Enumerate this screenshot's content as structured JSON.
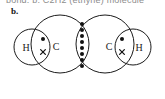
{
  "page": {
    "top_clipped_text": "bond. b. C2H2 (ethyne) molecule",
    "part_label": "b."
  },
  "diagram": {
    "name": "dot-and-cross-diagram",
    "molecule": "C2H2",
    "stroke_color": "#1b1b1b",
    "electron_color": "#111111",
    "background_color": "#ffffff",
    "atoms": [
      {
        "id": "h-left",
        "symbol": "H",
        "cx": 32,
        "cy": 47,
        "r": 18,
        "label_x": 26,
        "label_y": 47
      },
      {
        "id": "c-left",
        "symbol": "C",
        "cx": 60,
        "cy": 44,
        "r": 29,
        "label_x": 56,
        "label_y": 46
      },
      {
        "id": "c-right",
        "symbol": "C",
        "cx": 105,
        "cy": 44,
        "r": 29,
        "label_x": 109,
        "label_y": 46
      },
      {
        "id": "h-right",
        "symbol": "H",
        "cx": 133,
        "cy": 47,
        "r": 18,
        "label_x": 139,
        "label_y": 47
      }
    ],
    "bonds": [
      {
        "id": "bond-h-left-c-left",
        "type": "single",
        "electron_pairs": 1,
        "electrons": [
          {
            "kind": "dot",
            "x": 43,
            "y": 39
          },
          {
            "kind": "cross",
            "x": 43,
            "y": 52
          }
        ]
      },
      {
        "id": "bond-c-c",
        "type": "triple",
        "electron_pairs": 3,
        "electrons": [
          {
            "kind": "dot",
            "x": 82,
            "y": 24
          },
          {
            "kind": "dot",
            "x": 82,
            "y": 30
          },
          {
            "kind": "dot",
            "x": 82,
            "y": 36
          },
          {
            "kind": "dot",
            "x": 82,
            "y": 42
          },
          {
            "kind": "dot",
            "x": 82,
            "y": 48
          },
          {
            "kind": "dot",
            "x": 82,
            "y": 54
          },
          {
            "kind": "dot",
            "x": 82,
            "y": 60
          },
          {
            "kind": "dot",
            "x": 82,
            "y": 66
          }
        ]
      },
      {
        "id": "bond-c-right-h-right",
        "type": "single",
        "electron_pairs": 1,
        "electrons": [
          {
            "kind": "dot",
            "x": 122,
            "y": 39
          },
          {
            "kind": "cross",
            "x": 122,
            "y": 52
          }
        ]
      }
    ]
  }
}
